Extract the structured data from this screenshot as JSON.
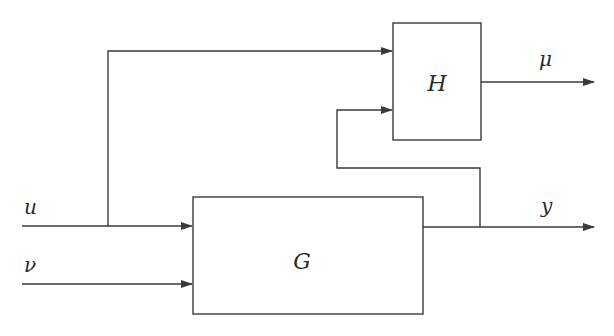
{
  "diagram": {
    "type": "block-diagram",
    "blocks": [
      {
        "id": "G",
        "label": "G"
      },
      {
        "id": "H",
        "label": "H"
      }
    ],
    "signals": {
      "u": "u",
      "nu": "ν",
      "y": "y",
      "mu": "μ"
    },
    "edges": [
      {
        "from": "u",
        "to": "G"
      },
      {
        "from": "nu",
        "to": "G"
      },
      {
        "from": "u",
        "to": "H",
        "note": "branch"
      },
      {
        "from": "G",
        "to": "y"
      },
      {
        "from": "y",
        "to": "H",
        "note": "feedback branch"
      },
      {
        "from": "H",
        "to": "mu"
      }
    ],
    "colors": {
      "line": "#3a3a3a",
      "background": "#ffffff"
    }
  }
}
